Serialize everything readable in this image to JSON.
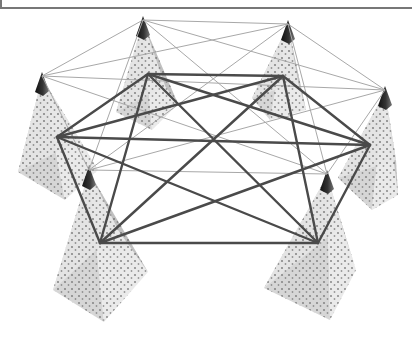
{
  "diagram": {
    "type": "network-of-pyramids",
    "node_count": 6,
    "colors": {
      "pyramid_fill_light": "#e6e6e6",
      "pyramid_fill_mid": "#cfcfcf",
      "pyramid_fill_dark": "#b9b9b9",
      "apex_cap": "#222222",
      "dot": "#6e6e6e",
      "thin_line": "#a8a8a8",
      "thick_line": "#4a4a4a",
      "frame": "#777777"
    },
    "nodes": [
      {
        "id": "p1",
        "apex": [
          143,
          16
        ],
        "center": [
          148,
          74
        ],
        "base": [
          [
            116,
            112
          ],
          [
            152,
            130
          ],
          [
            178,
            104
          ],
          [
            165,
            86
          ]
        ]
      },
      {
        "id": "p2",
        "apex": [
          288,
          20
        ],
        "center": [
          283,
          76
        ],
        "base": [
          [
            252,
            98
          ],
          [
            270,
            120
          ],
          [
            306,
            110
          ],
          [
            298,
            82
          ]
        ]
      },
      {
        "id": "p3",
        "apex": [
          42,
          72
        ],
        "center": [
          57,
          137
        ],
        "base": [
          [
            18,
            172
          ],
          [
            65,
            200
          ],
          [
            98,
            170
          ],
          [
            80,
            140
          ]
        ]
      },
      {
        "id": "p4",
        "apex": [
          385,
          86
        ],
        "center": [
          370,
          145
        ],
        "base": [
          [
            338,
            178
          ],
          [
            372,
            210
          ],
          [
            398,
            195
          ],
          [
            396,
            160
          ]
        ]
      },
      {
        "id": "p5",
        "apex": [
          89,
          166
        ],
        "center": [
          100,
          243
        ],
        "base": [
          [
            53,
            290
          ],
          [
            104,
            322
          ],
          [
            148,
            272
          ],
          [
            118,
            230
          ]
        ]
      },
      {
        "id": "p6",
        "apex": [
          327,
          170
        ],
        "center": [
          318,
          243
        ],
        "base": [
          [
            264,
            288
          ],
          [
            330,
            320
          ],
          [
            356,
            270
          ],
          [
            342,
            226
          ]
        ]
      }
    ],
    "thin_edges": "all apex pairs",
    "thick_edges": "all center pairs"
  }
}
